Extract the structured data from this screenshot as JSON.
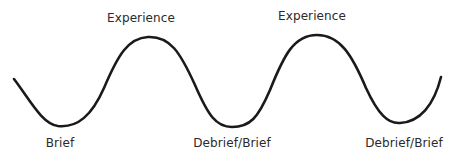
{
  "diagram": {
    "type": "wave-cycle",
    "line_color": "#1a1a1a",
    "peaks": [
      {
        "label": "Experience",
        "x": 141,
        "y": 18
      },
      {
        "label": "Experience",
        "x": 312,
        "y": 18
      }
    ],
    "troughs": [
      {
        "label": "Brief",
        "x": 58,
        "y": 138
      },
      {
        "label": "Debrief/Brief",
        "x": 232,
        "y": 138
      },
      {
        "label": "Debrief/Brief",
        "x": 402,
        "y": 138
      }
    ]
  }
}
